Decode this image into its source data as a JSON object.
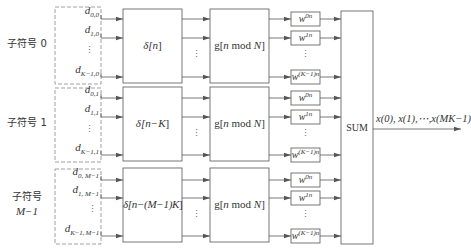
{
  "diagram": {
    "type": "block-diagram",
    "colors": {
      "line": "#555555",
      "dashed": "#888888",
      "text": "#333333",
      "background": "#ffffff"
    },
    "groups": [
      {
        "label": "子符号 0",
        "label_line1": "子符号 0",
        "label_line2": "",
        "inputs": [
          {
            "base": "d",
            "sub": "0,0"
          },
          {
            "base": "d",
            "sub": "1,0"
          },
          {
            "base": "d",
            "sub": "K−1,0"
          }
        ],
        "delay_base": "δ[",
        "delay_arg": "n",
        "delay_close": "]",
        "gate_prefix": "g[",
        "gate_n": "n",
        "gate_mod": " mod ",
        "gate_N": "N",
        "gate_close": "]",
        "weights": [
          {
            "base": "w",
            "sup": "0n"
          },
          {
            "base": "w",
            "sup": "1n"
          },
          {
            "base": "w",
            "sup": "(K−1)n"
          }
        ]
      },
      {
        "label": "子符号 1",
        "label_line1": "子符号 1",
        "label_line2": "",
        "inputs": [
          {
            "base": "d",
            "sub": "0,1"
          },
          {
            "base": "d",
            "sub": "1,1"
          },
          {
            "base": "d",
            "sub": "K−1,1"
          }
        ],
        "delay_base": "δ[",
        "delay_arg": "n−K",
        "delay_close": "]",
        "gate_prefix": "g[",
        "gate_n": "n",
        "gate_mod": " mod ",
        "gate_N": "N",
        "gate_close": "]",
        "weights": [
          {
            "base": "w",
            "sup": "0n"
          },
          {
            "base": "w",
            "sup": "1n"
          },
          {
            "base": "w",
            "sup": "(K−1)n"
          }
        ]
      },
      {
        "label": "子符号 M−1",
        "label_line1": "子符号",
        "label_line2": "M−1",
        "inputs": [
          {
            "base": "d",
            "sub": "0, M−1"
          },
          {
            "base": "d",
            "sub": "1, M−1"
          },
          {
            "base": "d",
            "sub": "K−1, M−1"
          }
        ],
        "delay_base": "δ[",
        "delay_arg": "n−(M−1)K",
        "delay_close": "]",
        "gate_prefix": "g[",
        "gate_n": "n",
        "gate_mod": " mod ",
        "gate_N": "N",
        "gate_close": "]",
        "weights": [
          {
            "base": "w",
            "sup": "0n"
          },
          {
            "base": "w",
            "sup": "1n"
          },
          {
            "base": "w",
            "sup": "(K−1)n"
          }
        ]
      }
    ],
    "ellipsis": "⋮",
    "sum_label": "SUM",
    "output_label": "x(0), x(1),⋯,x(MK−1)"
  }
}
